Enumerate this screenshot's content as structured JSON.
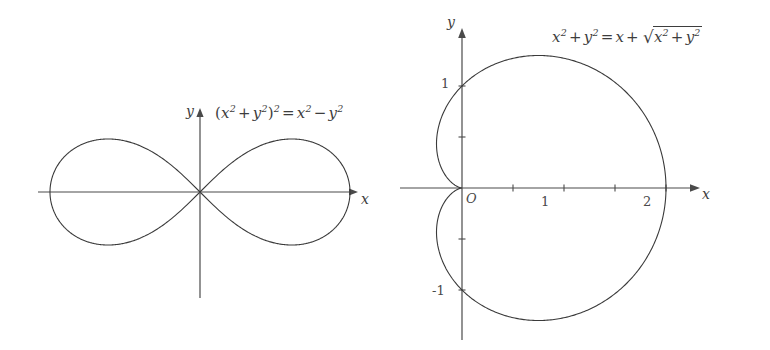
{
  "canvas": {
    "width": 770,
    "height": 350,
    "background": "#ffffff",
    "stroke": "#3a3a3a"
  },
  "figures": [
    {
      "id": "lemniscate",
      "equation_parts": {
        "lhs_open": "(",
        "lhs_x": "x",
        "lhs_x_exp": "2",
        "plus": "+",
        "lhs_y": "y",
        "lhs_y_exp": "2",
        "lhs_close": ")",
        "lhs_close_exp": "2",
        "equals": "=",
        "rhs_x": "x",
        "rhs_x_exp": "2",
        "minus": "−",
        "rhs_y": "y",
        "rhs_y_exp": "2"
      },
      "equation_text": "(x² + y²)² = x² − y²",
      "axis_labels": {
        "x": "x",
        "y": "y"
      },
      "tick_labels": [],
      "origin_label": ""
    },
    {
      "id": "cardioid",
      "equation_parts": {
        "lhs_x": "x",
        "lhs_x_exp": "2",
        "plus": "+",
        "lhs_y": "y",
        "lhs_y_exp": "2",
        "equals": "=",
        "rhs_x": "x",
        "plus2": "+",
        "radical_sign": "√",
        "rad_x": "x",
        "rad_x_exp": "2",
        "rad_plus": "+",
        "rad_y": "y",
        "rad_y_exp": "2"
      },
      "equation_text": "x² + y² = x + √(x² + y²)",
      "axis_labels": {
        "x": "x",
        "y": "y"
      },
      "origin_label": "O",
      "tick_labels": {
        "y_pos_1": "1",
        "y_neg_1": "-1",
        "x_1": "1",
        "x_2": "2"
      }
    }
  ],
  "chart_data": [
    {
      "type": "line",
      "name": "lemniscate-of-bernoulli",
      "title": "(x² + y²)² = x² − y²",
      "polar_equation": "r^2 = cos(2*theta)",
      "xlabel": "x",
      "ylabel": "y",
      "grid": false,
      "legend": "none",
      "origin_px": [
        200,
        192
      ],
      "px_per_unit": 150,
      "xlim": [
        -1,
        1
      ],
      "ylim": [
        -0.5,
        0.5
      ],
      "x_extent_units": [
        -1,
        1
      ],
      "y_extent_units": [
        -0.3536,
        0.3536
      ],
      "tick_values_x": [],
      "tick_values_y": [],
      "axis_span_px": {
        "x": [
          38,
          358
        ],
        "y": [
          108,
          298
        ]
      }
    },
    {
      "type": "line",
      "name": "cardioid",
      "title": "x² + y² = x + √(x² + y²)",
      "polar_equation": "r = 1 + cos(theta)",
      "xlabel": "x",
      "ylabel": "y",
      "grid": false,
      "legend": "none",
      "origin_px": [
        462,
        188
      ],
      "px_per_unit": 102,
      "xlim": [
        -0.3,
        2.3
      ],
      "ylim": [
        -1.4,
        1.4
      ],
      "x_extent_units": [
        -0.25,
        2
      ],
      "y_extent_units": [
        -1.3,
        1.3
      ],
      "tick_values_x": [
        0.5,
        1,
        1.5,
        2
      ],
      "tick_values_y": [
        -1,
        -0.5,
        0.5,
        1
      ],
      "labeled_ticks_x": [
        1,
        2
      ],
      "labeled_ticks_y": [
        -1,
        1
      ],
      "axis_span_px": {
        "x": [
          400,
          700
        ],
        "y": [
          28,
          340
        ]
      }
    }
  ]
}
